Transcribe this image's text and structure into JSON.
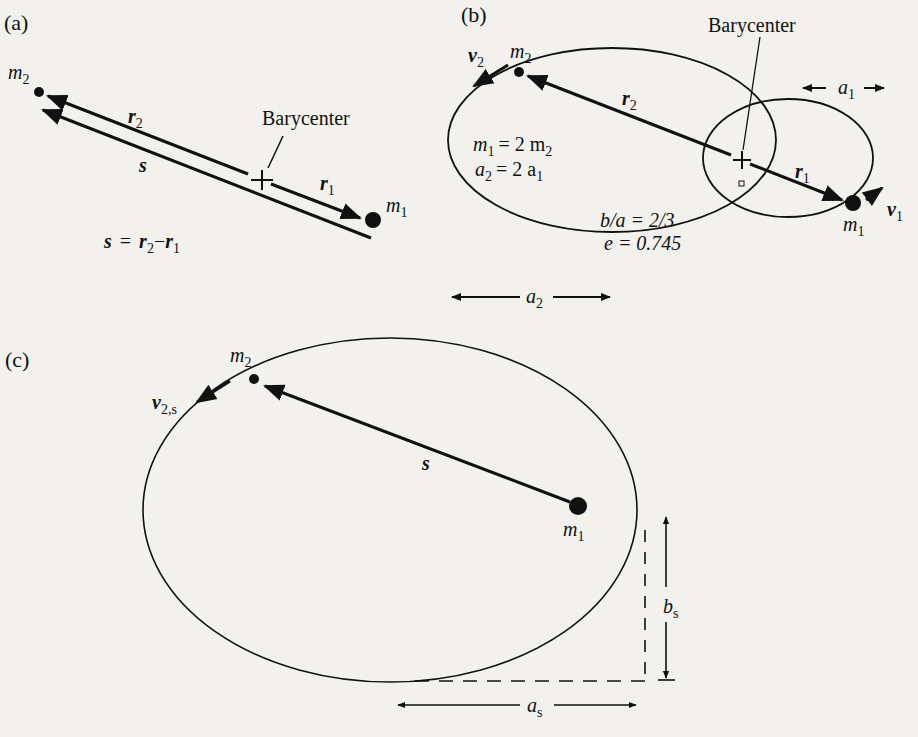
{
  "figure": {
    "panels": {
      "a": {
        "label": "(a)",
        "m2_label": "m",
        "m2_sub": "2",
        "m1_label": "m",
        "m1_sub": "1",
        "r2_label": "r",
        "r2_sub": "2",
        "r1_label": "r",
        "r1_sub": "1",
        "s_label": "s",
        "barycenter_label": "Barycenter",
        "equation": {
          "lhs": "s",
          "eq": "=",
          "t1": "r",
          "t1_sub": "2",
          "minus": "−",
          "t2": "r",
          "t2_sub": "1"
        }
      },
      "b": {
        "label": "(b)",
        "barycenter_label": "Barycenter",
        "v2_label": "v",
        "v2_sub": "2",
        "m2_label": "m",
        "m2_sub": "2",
        "r2_label": "r",
        "r2_sub": "2",
        "r1_label": "r",
        "r1_sub": "1",
        "m1_label": "m",
        "m1_sub": "1",
        "v1_label": "v",
        "v1_sub": "1",
        "a1_label": "a",
        "a1_sub": "1",
        "a2_label": "a",
        "a2_sub": "2",
        "relation1": {
          "lhs": "m",
          "lhs_sub": "1",
          "rhs": "= 2 m",
          "rhs_sub": "2"
        },
        "relation2": {
          "lhs": "a",
          "lhs_sub": "2",
          "rhs": "= 2 a",
          "rhs_sub": "1"
        },
        "axis_ratio": "b/a = 2/3",
        "eccentricity": "e = 0.745"
      },
      "c": {
        "label": "(c)",
        "m2_label": "m",
        "m2_sub": "2",
        "v2s_label": "v",
        "v2s_sub": "2,s",
        "s_label": "s",
        "m1_label": "m",
        "m1_sub": "1",
        "bs_label": "b",
        "bs_sub": "s",
        "as_label": "a",
        "as_sub": "s"
      }
    },
    "colors": {
      "ink": "#111111",
      "paper": "#f2f1ee",
      "showthrough": "#cfcdc8"
    }
  }
}
